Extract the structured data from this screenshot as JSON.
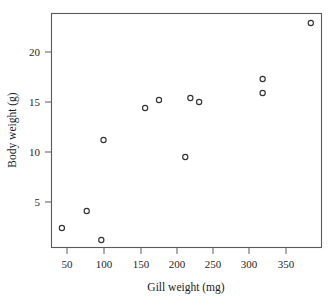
{
  "chart_data": {
    "type": "scatter",
    "title": "",
    "xlabel": "Gill weight (mg)",
    "ylabel": "Body weight (g)",
    "xlim": [
      27,
      400
    ],
    "ylim": [
      0.3,
      23.8
    ],
    "xticks": [
      50,
      100,
      150,
      200,
      250,
      300,
      350
    ],
    "xtick_labels": [
      "50",
      "100",
      "150",
      "200",
      "250",
      "300",
      "350"
    ],
    "yticks": [
      5,
      10,
      15,
      20
    ],
    "ytick_labels": [
      "5",
      "10",
      "15",
      "20"
    ],
    "grid": false,
    "legend": false,
    "marker": "open-circle",
    "marker_color": "#333333",
    "x": [
      43,
      77,
      97,
      100,
      157,
      176,
      212,
      219,
      231,
      318,
      318,
      384
    ],
    "y": [
      2.4,
      4.1,
      1.2,
      11.2,
      14.4,
      15.2,
      9.5,
      15.4,
      15.0,
      17.3,
      15.9,
      22.9
    ],
    "points": [
      {
        "x": 43,
        "y": 2.4
      },
      {
        "x": 77,
        "y": 4.1
      },
      {
        "x": 97,
        "y": 1.2
      },
      {
        "x": 100,
        "y": 11.2
      },
      {
        "x": 157,
        "y": 14.4
      },
      {
        "x": 176,
        "y": 15.2
      },
      {
        "x": 212,
        "y": 9.5
      },
      {
        "x": 219,
        "y": 15.4
      },
      {
        "x": 231,
        "y": 15.0
      },
      {
        "x": 318,
        "y": 17.3
      },
      {
        "x": 318,
        "y": 15.9
      },
      {
        "x": 384,
        "y": 22.9
      }
    ]
  },
  "figure": {
    "background_color": "#ffffff",
    "frame_color": "#5a5a5a",
    "text_color": "#1a1a1a"
  }
}
